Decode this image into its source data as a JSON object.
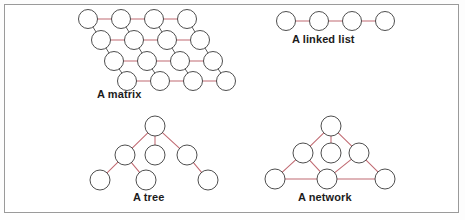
{
  "figure": {
    "background_color": "#ffffff",
    "frame_color": "#9a9a9a",
    "node_stroke_color": "#3a3a3a",
    "node_fill_color": "#ffffff",
    "edge_color_primary": "#c06a72",
    "edge_color_secondary": "#4a4a4a",
    "caption_color": "#1c1c1c"
  },
  "diagrams": {
    "matrix": {
      "caption": "A matrix",
      "type": "skewed-lattice",
      "rows": 4,
      "columns": 4,
      "node_radius": 9.5,
      "row_origins": [
        {
          "x": 88,
          "y": 19
        },
        {
          "x": 101,
          "y": 40
        },
        {
          "x": 114,
          "y": 61
        },
        {
          "x": 127,
          "y": 81
        }
      ],
      "column_spacing": 33,
      "horizontal_edge_color": "#c06a72",
      "diagonal_edge_color": "#4a4a4a"
    },
    "linked_list": {
      "caption": "A linked list",
      "type": "chain",
      "node_count": 4,
      "node_radius": 9.5,
      "start": {
        "x": 286,
        "y": 21
      },
      "spacing": 33,
      "edge_color": "#c06a72"
    },
    "tree": {
      "caption": "A tree",
      "type": "tree",
      "node_count": 7,
      "node_radius": 10,
      "nodes": [
        {
          "id": "root",
          "x": 155,
          "y": 126
        },
        {
          "id": "c1",
          "x": 125,
          "y": 155
        },
        {
          "id": "c2",
          "x": 155,
          "y": 155
        },
        {
          "id": "c3",
          "x": 187,
          "y": 155
        },
        {
          "id": "g1",
          "x": 100,
          "y": 180
        },
        {
          "id": "g2",
          "x": 146,
          "y": 180
        },
        {
          "id": "g3",
          "x": 208,
          "y": 180
        }
      ],
      "edges": [
        [
          "root",
          "c1"
        ],
        [
          "root",
          "c2"
        ],
        [
          "root",
          "c3"
        ],
        [
          "c1",
          "g1"
        ],
        [
          "c1",
          "g2"
        ],
        [
          "c3",
          "g3"
        ]
      ],
      "edge_color": "#c06a72"
    },
    "network": {
      "caption": "A network",
      "type": "graph",
      "node_count": 7,
      "node_radius": 10,
      "nodes": [
        {
          "id": "top",
          "x": 331,
          "y": 126
        },
        {
          "id": "midl",
          "x": 303,
          "y": 153
        },
        {
          "id": "midc",
          "x": 331,
          "y": 153
        },
        {
          "id": "midr",
          "x": 359,
          "y": 153
        },
        {
          "id": "botl",
          "x": 275,
          "y": 179
        },
        {
          "id": "botc",
          "x": 327,
          "y": 179
        },
        {
          "id": "botr",
          "x": 385,
          "y": 179
        }
      ],
      "edges": [
        [
          "top",
          "midl"
        ],
        [
          "top",
          "midc"
        ],
        [
          "top",
          "midr"
        ],
        [
          "midl",
          "botl"
        ],
        [
          "midl",
          "botc"
        ],
        [
          "midr",
          "botc"
        ],
        [
          "midr",
          "botr"
        ],
        [
          "botl",
          "botc"
        ],
        [
          "botc",
          "botr"
        ]
      ],
      "edge_color": "#c06a72"
    }
  }
}
